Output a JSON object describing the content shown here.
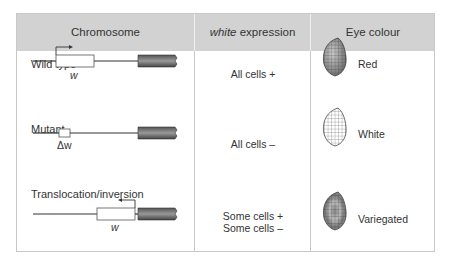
{
  "header": {
    "col1": "Chromosome",
    "col2_italic": "white",
    "col2_rest": " expression",
    "col3": "Eye colour"
  },
  "rows": [
    {
      "chromosome_label": "Wild type",
      "gene_label": "w",
      "expression": [
        "All cells +"
      ],
      "eye_colour": "Red"
    },
    {
      "chromosome_label": "Mutant",
      "gene_label": "Δw",
      "expression": [
        "All cells –"
      ],
      "eye_colour": "White"
    },
    {
      "chromosome_label": "Translocation/inversion",
      "gene_label": "w",
      "expression": [
        "Some cells +",
        "Some cells –"
      ],
      "eye_colour": "Variegated"
    }
  ],
  "colors": {
    "header_bg": "#d2d2d2",
    "border": "#c8c8c8",
    "heterochromatin": "#6e6e6e"
  }
}
